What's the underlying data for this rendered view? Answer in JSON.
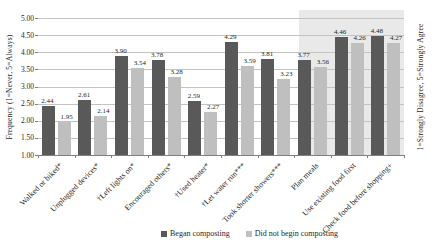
{
  "chart_data": {
    "type": "bar",
    "title": "",
    "categories": [
      "Walked or biked*",
      "Unplugged devices*",
      "†Left lights on*",
      "Encouraged others*",
      "†Used heater*",
      "†Let water run***",
      "Took shorter showers***",
      "Plan meals",
      "Use existing food first",
      "Check food before shopping+"
    ],
    "series": [
      {
        "name": "Began composting",
        "color": "#595959",
        "values": [
          2.44,
          2.61,
          3.9,
          3.78,
          2.59,
          4.29,
          3.81,
          3.77,
          4.46,
          4.48
        ]
      },
      {
        "name": "Did not begin composting",
        "color": "#bfbfbf",
        "values": [
          1.95,
          2.14,
          3.54,
          3.28,
          2.27,
          3.59,
          3.23,
          3.56,
          4.26,
          4.27
        ]
      }
    ],
    "ylabel_left": "Frequency (1=Never, 5=Always)",
    "ylabel_right": "1=Strongly Disagree, 5=Strongly Agree",
    "ylim": [
      1.0,
      5.0
    ],
    "ytick_step": 0.5,
    "yticks": [
      "5.00",
      "4.50",
      "4.00",
      "3.50",
      "3.00",
      "2.50",
      "2.00",
      "1.50",
      "1.00"
    ],
    "grid": true,
    "data_labels": true,
    "legend_position": "bottom",
    "highlight_band": {
      "start_index": 7,
      "end_index": 9,
      "color": "#e9e9e9",
      "categories_covered": [
        "Plan meals",
        "Use existing food first",
        "Check food before shopping+"
      ]
    },
    "colors": {
      "gridline": "#c3c3c3",
      "axis_line": "#808080",
      "text": "#1f1f1f",
      "background": "#ffffff"
    }
  }
}
